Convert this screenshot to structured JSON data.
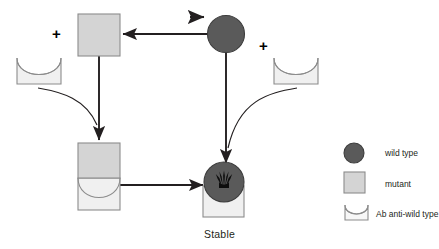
{
  "diagram": {
    "title_label": "Stable",
    "plus_symbol": "+",
    "operators": [
      {
        "name": "plus-left",
        "symbol": "+"
      },
      {
        "name": "plus-right",
        "symbol": "+"
      }
    ],
    "nodes": [
      {
        "id": "mutant-top",
        "type": "mutant-square",
        "label": ""
      },
      {
        "id": "wildtype-top",
        "type": "wildtype-circle",
        "label": ""
      },
      {
        "id": "antibody-left",
        "type": "antibody-cup",
        "label": ""
      },
      {
        "id": "antibody-right",
        "type": "antibody-cup",
        "label": ""
      },
      {
        "id": "mutant-antibody-complex",
        "type": "mutant-square-on-antibody",
        "label": ""
      },
      {
        "id": "stable-complex",
        "type": "wildtype-circle-in-antibody",
        "label": "Stable"
      }
    ],
    "edges": [
      {
        "id": "wildtype-to-mutant",
        "from": "wildtype-top",
        "to": "mutant-top",
        "style": "straight-arrow-left"
      },
      {
        "id": "incoming-stimulus",
        "from": "",
        "to": "wildtype-top",
        "style": "short-arrow-right"
      },
      {
        "id": "mutant-down",
        "from": "mutant-top",
        "to": "mutant-antibody-complex",
        "style": "straight-arrow-down"
      },
      {
        "id": "wildtype-down",
        "from": "wildtype-top",
        "to": "stable-complex",
        "style": "straight-arrow-down"
      },
      {
        "id": "antibody-left-curve",
        "from": "antibody-left",
        "to": "mutant-down",
        "style": "curve"
      },
      {
        "id": "antibody-right-curve",
        "from": "antibody-right",
        "to": "wildtype-down",
        "style": "curve"
      },
      {
        "id": "complex-to-stable",
        "from": "mutant-antibody-complex",
        "to": "stable-complex",
        "style": "straight-arrow-right"
      }
    ]
  },
  "legend": {
    "items": [
      {
        "key": "wild-type",
        "label": "wild type",
        "glyph": "circle",
        "color": "#5a5a5a"
      },
      {
        "key": "mutant",
        "label": "mutant",
        "glyph": "square",
        "color": "#d9d9d9"
      },
      {
        "key": "ab-anti-wild-type",
        "label": "Ab anti-wild type",
        "glyph": "cup",
        "color": "#f2f2f2"
      }
    ]
  },
  "colors": {
    "wild_type_fill": "#5a5a5a",
    "wild_type_stroke": "#3d3d3d",
    "mutant_fill": "#d4d4d4",
    "mutant_stroke": "#8c8c8c",
    "antibody_fill": "#f0f0f0",
    "antibody_stroke": "#8c8c8c",
    "arrow": "#231f20",
    "text": "#231f20",
    "background": "#ffffff"
  }
}
